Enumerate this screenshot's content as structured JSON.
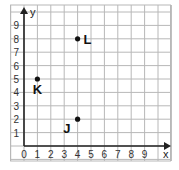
{
  "chart_data": {
    "type": "scatter",
    "title": "",
    "xlabel": "x",
    "ylabel": "y",
    "xlim": [
      0,
      10
    ],
    "ylim": [
      0,
      10
    ],
    "grid": true,
    "x_ticks": [
      "0",
      "1",
      "2",
      "3",
      "4",
      "5",
      "6",
      "7",
      "8",
      "9"
    ],
    "y_ticks": [
      "1",
      "2",
      "3",
      "4",
      "5",
      "6",
      "7",
      "8",
      "9"
    ],
    "points": [
      {
        "label": "L",
        "x": 4,
        "y": 8
      },
      {
        "label": "K",
        "x": 1,
        "y": 5
      },
      {
        "label": "J",
        "x": 4,
        "y": 2
      }
    ]
  }
}
